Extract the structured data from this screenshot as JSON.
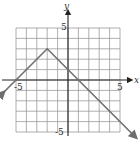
{
  "chart_data": {
    "type": "line",
    "title": "",
    "xlabel": "x",
    "ylabel": "y",
    "xlim": [
      -5,
      5
    ],
    "ylim": [
      -5,
      5
    ],
    "grid": true,
    "tick_labels": {
      "x": [
        "-5",
        "5"
      ],
      "y": [
        "5",
        "-5"
      ]
    },
    "series": [
      {
        "name": "y = -|x + 2| + 3",
        "x": [
          -6.3,
          -2,
          6.4
        ],
        "y": [
          -1.3,
          3,
          -5.4
        ],
        "color": "#6e6e6e",
        "arrows": "both-ends"
      }
    ],
    "key_points": {
      "vertex": [
        -2,
        3
      ],
      "x_intercepts": [
        -5,
        1
      ],
      "y_intercept": 1
    }
  },
  "labels": {
    "x_axis": "x",
    "y_axis": "y",
    "x_neg": "-5",
    "x_pos": "5",
    "y_pos": "5",
    "y_neg": "-5"
  },
  "colors": {
    "grid": "#9a9a9a",
    "axis": "#222222",
    "curve": "#6e6e6e"
  }
}
